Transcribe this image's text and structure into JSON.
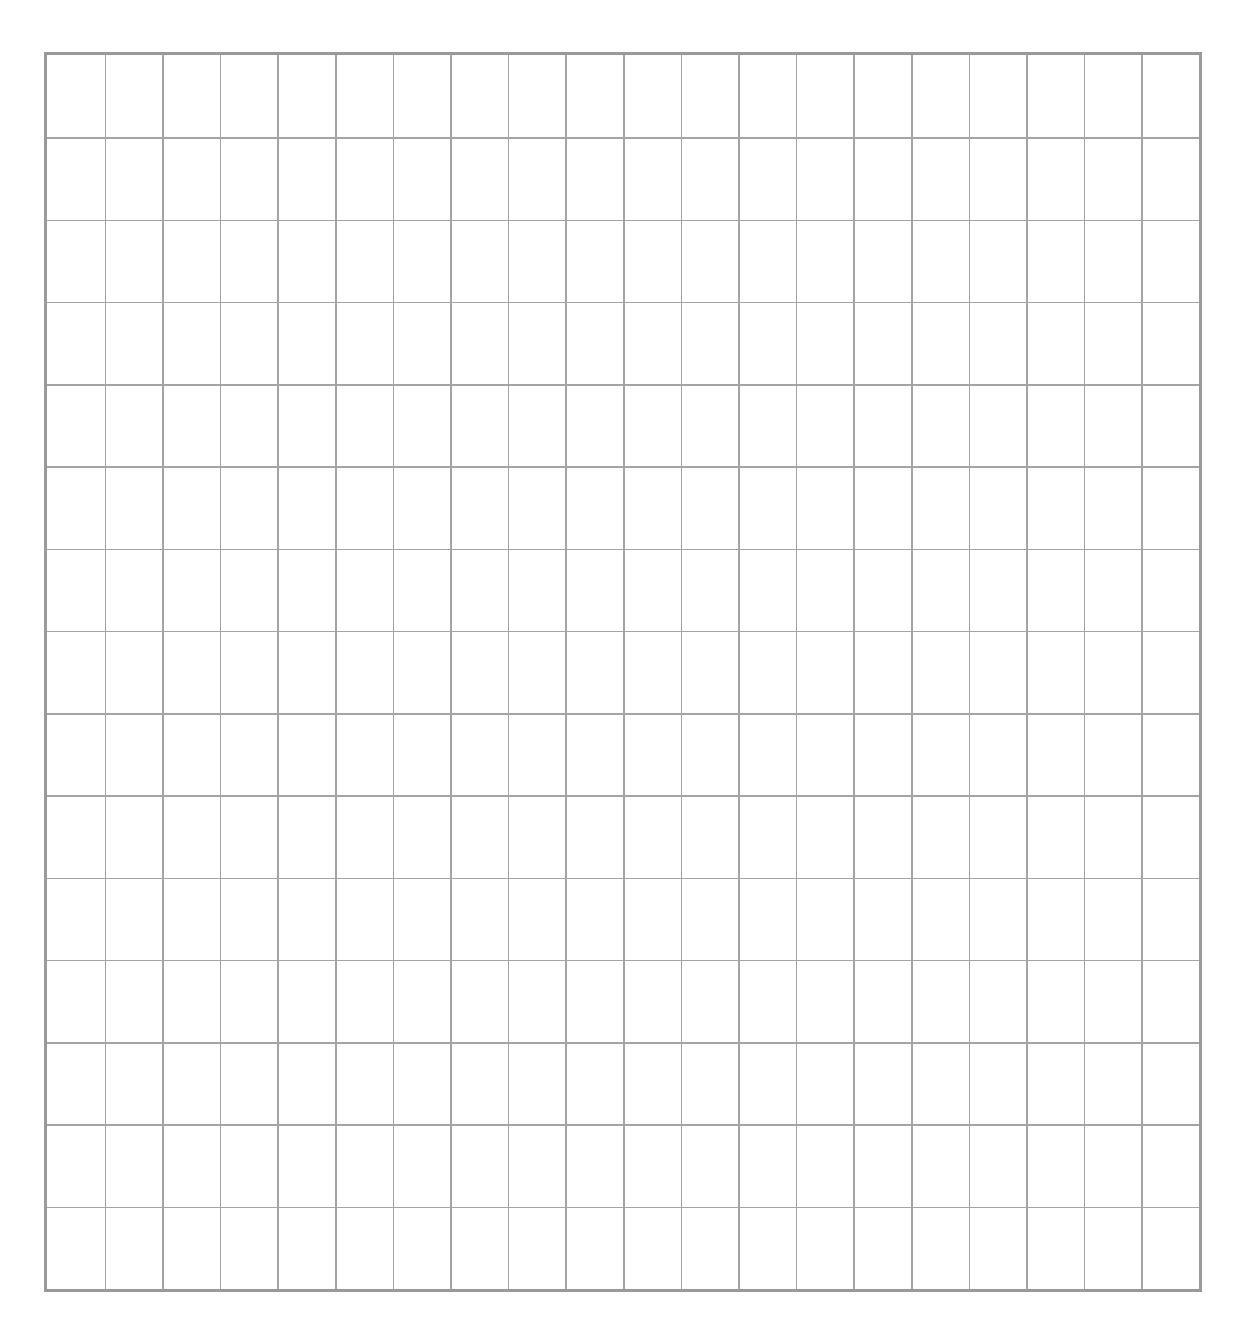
{
  "grid": {
    "columns": 20,
    "rows": 15,
    "line_color": "#a4a4a4",
    "border_color": "#9a9a9a",
    "background": "#ffffff"
  }
}
